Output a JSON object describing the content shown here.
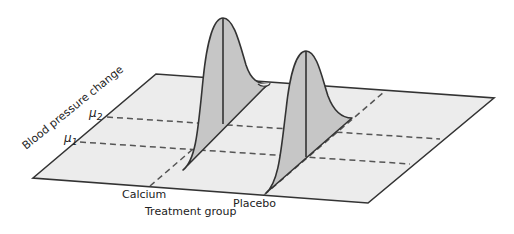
{
  "diagram": {
    "type": "3d-distribution-plane",
    "axes": {
      "y_label": "Blood pressure change",
      "x_label": "Treatment group"
    },
    "groups": [
      {
        "name": "Calcium",
        "mean_label": "μ2",
        "mean_symbol": "μ",
        "mean_sub": "2"
      },
      {
        "name": "Placebo",
        "mean_label": "μ1",
        "mean_symbol": "μ",
        "mean_sub": "1"
      }
    ],
    "mean_labels": [
      {
        "symbol": "μ",
        "sub": "2"
      },
      {
        "symbol": "μ",
        "sub": "1"
      }
    ],
    "colors": {
      "plane": "#ececec",
      "curve_fill": "#c6c6c6",
      "stroke": "#333333",
      "dash": "#555555"
    }
  }
}
